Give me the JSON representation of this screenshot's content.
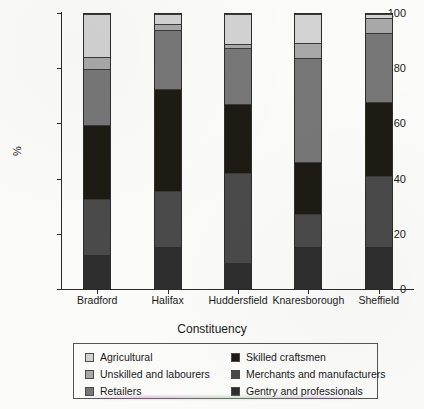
{
  "chart_data": {
    "type": "bar",
    "subtype": "stacked-bar-100",
    "title": "",
    "xlabel": "Constituency",
    "ylabel": "%",
    "ylim": [
      0,
      100
    ],
    "yticks": [
      0,
      20,
      40,
      60,
      80,
      100
    ],
    "grid": false,
    "legend_position": "bottom",
    "categories": [
      "Bradford",
      "Halifax",
      "Huddersfield",
      "Knaresborough",
      "Sheffield"
    ],
    "series": [
      {
        "name": "Gentry and professionals",
        "color": "#2e2e2e",
        "values": [
          12.0,
          15.0,
          9.0,
          15.0,
          15.0
        ]
      },
      {
        "name": "Merchants and manufacturers",
        "color": "#4a4a4a",
        "values": [
          20.5,
          20.5,
          33.0,
          12.0,
          26.0
        ]
      },
      {
        "name": "Skilled craftsmen",
        "color": "#1e1a14",
        "values": [
          27.0,
          37.0,
          25.0,
          19.0,
          27.0
        ]
      },
      {
        "name": "Retailers",
        "color": "#777777",
        "values": [
          20.5,
          21.5,
          20.5,
          38.0,
          25.0
        ]
      },
      {
        "name": "Unskilled and labourers",
        "color": "#a8a8a8",
        "values": [
          4.5,
          2.5,
          1.5,
          5.5,
          5.5
        ]
      },
      {
        "name": "Agricultural",
        "color": "#d2d2d2",
        "values": [
          15.5,
          3.5,
          11.0,
          10.5,
          1.5
        ]
      }
    ],
    "stack_tops": {
      "Bradford": [
        12.0,
        32.5,
        59.5,
        80.0,
        84.5,
        100.0
      ],
      "Halifax": [
        15.0,
        35.5,
        72.5,
        94.0,
        96.5,
        100.0
      ],
      "Huddersfield": [
        9.0,
        42.0,
        67.0,
        87.5,
        89.0,
        100.0
      ],
      "Knaresborough": [
        15.0,
        27.0,
        46.0,
        84.0,
        89.5,
        100.0
      ],
      "Sheffield": [
        15.0,
        41.0,
        68.0,
        93.0,
        98.5,
        100.0
      ]
    }
  },
  "legend": {
    "left_column": [
      {
        "label": "Agricultural",
        "color": "#d2d2d2"
      },
      {
        "label": "Unskilled and labourers",
        "color": "#a8a8a8"
      },
      {
        "label": "Retailers",
        "color": "#777777"
      }
    ],
    "right_column": [
      {
        "label": "Skilled craftsmen",
        "color": "#1e1a14"
      },
      {
        "label": "Merchants and manufacturers",
        "color": "#4a4a4a"
      },
      {
        "label": "Gentry and professionals",
        "color": "#2e2e2e"
      }
    ]
  },
  "axes": {
    "y_title": "%",
    "x_title": "Constituency",
    "y_tick_labels": [
      "0",
      "20",
      "40",
      "60",
      "80",
      "100"
    ]
  }
}
